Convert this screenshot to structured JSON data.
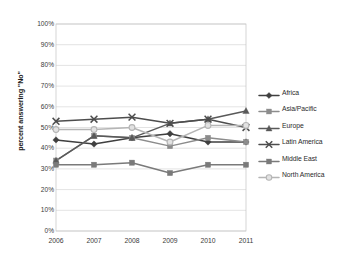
{
  "chart_data": {
    "type": "line",
    "title": "",
    "xlabel": "",
    "ylabel": "percent answering \"No\"",
    "categories": [
      "2006",
      "2007",
      "2008",
      "2009",
      "2010",
      "2011"
    ],
    "ylim": [
      0,
      100
    ],
    "ytick_labels": [
      "100%",
      "90%",
      "80%",
      "70%",
      "60%",
      "50%",
      "40%",
      "30%",
      "20%",
      "10%",
      "0%"
    ],
    "ytick_values": [
      100,
      90,
      80,
      70,
      60,
      50,
      40,
      30,
      20,
      10,
      0
    ],
    "grid": "horizontal",
    "legend_position": "right",
    "series": [
      {
        "name": "Africa",
        "values": [
          44,
          42,
          45,
          47,
          43,
          43
        ],
        "color": "#3f3f3f",
        "marker": "diamond"
      },
      {
        "name": "Asia/Pacific",
        "values": [
          34,
          46,
          45,
          41,
          45,
          43
        ],
        "color": "#8c8c8c",
        "marker": "square"
      },
      {
        "name": "Europe",
        "values": [
          34,
          46,
          45,
          52,
          54,
          58
        ],
        "color": "#595959",
        "marker": "triangle"
      },
      {
        "name": "Latin America",
        "values": [
          53,
          54,
          55,
          52,
          54,
          50
        ],
        "color": "#4d4d4d",
        "marker": "cross"
      },
      {
        "name": "Middle East",
        "values": [
          32,
          32,
          33,
          28,
          32,
          32
        ],
        "color": "#7a7a7a",
        "marker": "square"
      },
      {
        "name": "North America",
        "values": [
          49,
          49,
          50,
          43,
          51,
          51
        ],
        "color": "#b5b5b5",
        "marker": "circle"
      }
    ]
  },
  "axis": {
    "y_title": "percent answering \"No\"",
    "y_labels": [
      "100%",
      "90%",
      "80%",
      "70%",
      "60%",
      "50%",
      "40%",
      "30%",
      "20%",
      "10%",
      "0%"
    ],
    "x_labels": [
      "2006",
      "2007",
      "2008",
      "2009",
      "2010",
      "2011"
    ]
  },
  "legend": {
    "items": [
      {
        "label": "Africa"
      },
      {
        "label": "Asia/Pacific"
      },
      {
        "label": "Europe"
      },
      {
        "label": "Latin America"
      },
      {
        "label": "Middle East"
      },
      {
        "label": "North America"
      }
    ]
  }
}
